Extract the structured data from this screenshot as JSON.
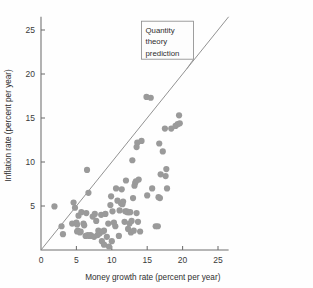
{
  "chart_data": {
    "type": "scatter",
    "title": "",
    "xlabel": "Money growth rate (percent per year)",
    "ylabel": "Inflation rate (percent per year)",
    "xlim": [
      0,
      26.5
    ],
    "ylim": [
      0,
      26.5
    ],
    "xticks": [
      0,
      5,
      10,
      15,
      20,
      25
    ],
    "yticks": [
      5,
      10,
      15,
      20,
      25
    ],
    "xtick_labels": [
      "0",
      "5",
      "10",
      "15",
      "20",
      "25"
    ],
    "ytick_labels": [
      "5",
      "10",
      "15",
      "20",
      "25"
    ],
    "grid": false,
    "legend_position": "none",
    "marker_color": "#9a9a9a",
    "marker_size": 3.1,
    "annotations": [
      {
        "name": "quantity-theory-prediction",
        "text_lines": [
          "Quantity",
          "theory",
          "prediction"
        ],
        "box_x": 14.2,
        "box_y": 26.0,
        "leader_to_x": 20.6,
        "leader_to_y": 20.6
      }
    ],
    "reference_line": {
      "name": "quantity-theory-prediction-line",
      "description": "45 degree line where inflation equals money growth",
      "slope": 1,
      "intercept": 0,
      "color": "#8c8c8c",
      "x_from": 0,
      "x_to": 26.5
    },
    "points": [
      [
        1.9,
        4.95
      ],
      [
        2.9,
        2.7
      ],
      [
        3.1,
        1.8
      ],
      [
        4.4,
        3.0
      ],
      [
        4.6,
        5.4
      ],
      [
        4.8,
        4.8
      ],
      [
        5.0,
        3.1
      ],
      [
        5.1,
        2.9
      ],
      [
        5.1,
        2.1
      ],
      [
        5.2,
        2.2
      ],
      [
        5.3,
        3.9
      ],
      [
        5.5,
        2.0
      ],
      [
        5.6,
        2.1
      ],
      [
        5.7,
        4.3
      ],
      [
        6.0,
        3.0
      ],
      [
        6.1,
        2.8
      ],
      [
        6.3,
        1.6
      ],
      [
        6.4,
        4.2
      ],
      [
        6.5,
        9.1
      ],
      [
        6.6,
        1.7
      ],
      [
        6.7,
        6.5
      ],
      [
        6.8,
        1.6
      ],
      [
        7.0,
        1.7
      ],
      [
        7.1,
        1.6
      ],
      [
        7.3,
        3.8
      ],
      [
        7.5,
        1.5
      ],
      [
        7.6,
        4.1
      ],
      [
        7.8,
        3.3
      ],
      [
        8.0,
        1.7
      ],
      [
        8.1,
        2.2
      ],
      [
        8.3,
        1.9
      ],
      [
        8.5,
        4.0
      ],
      [
        8.6,
        1.0
      ],
      [
        8.7,
        2.1
      ],
      [
        8.9,
        0.6
      ],
      [
        8.9,
        2.2
      ],
      [
        9.1,
        4.1
      ],
      [
        9.3,
        1.5
      ],
      [
        9.5,
        3.0
      ],
      [
        9.6,
        0.4
      ],
      [
        9.8,
        5.1
      ],
      [
        9.9,
        6.1
      ],
      [
        10.0,
        1.0
      ],
      [
        10.1,
        4.4
      ],
      [
        10.3,
        3.1
      ],
      [
        10.5,
        2.7
      ],
      [
        10.6,
        7.0
      ],
      [
        10.8,
        5.6
      ],
      [
        11.0,
        1.6
      ],
      [
        11.1,
        4.5
      ],
      [
        11.3,
        5.3
      ],
      [
        11.4,
        6.9
      ],
      [
        11.5,
        5.2
      ],
      [
        11.6,
        5.5
      ],
      [
        11.8,
        3.2
      ],
      [
        11.9,
        4.4
      ],
      [
        12.0,
        7.9
      ],
      [
        12.1,
        4.4
      ],
      [
        12.2,
        4.3
      ],
      [
        12.3,
        2.4
      ],
      [
        12.4,
        4.3
      ],
      [
        12.5,
        3.0
      ],
      [
        12.6,
        4.3
      ],
      [
        12.7,
        2.0
      ],
      [
        12.8,
        3.3
      ],
      [
        12.9,
        10.2
      ],
      [
        13.0,
        5.9
      ],
      [
        13.1,
        2.2
      ],
      [
        13.2,
        7.3
      ],
      [
        13.3,
        7.6
      ],
      [
        13.4,
        7.8
      ],
      [
        13.5,
        11.7
      ],
      [
        13.5,
        4.2
      ],
      [
        13.6,
        12.2
      ],
      [
        13.7,
        3.2
      ],
      [
        13.8,
        8.0
      ],
      [
        14.0,
        2.1
      ],
      [
        14.2,
        12.4
      ],
      [
        14.9,
        17.4
      ],
      [
        15.0,
        6.2
      ],
      [
        15.5,
        17.3
      ],
      [
        15.7,
        7.0
      ],
      [
        16.2,
        2.7
      ],
      [
        16.5,
        2.7
      ],
      [
        16.6,
        6.0
      ],
      [
        16.7,
        12.1
      ],
      [
        16.8,
        5.9
      ],
      [
        16.9,
        8.6
      ],
      [
        17.2,
        11.2
      ],
      [
        17.5,
        13.8
      ],
      [
        17.6,
        8.4
      ],
      [
        17.7,
        9.2
      ],
      [
        17.8,
        7.0
      ],
      [
        18.4,
        13.8
      ],
      [
        19.0,
        14.1
      ],
      [
        19.3,
        14.3
      ],
      [
        19.5,
        15.3
      ],
      [
        19.6,
        14.4
      ]
    ]
  }
}
